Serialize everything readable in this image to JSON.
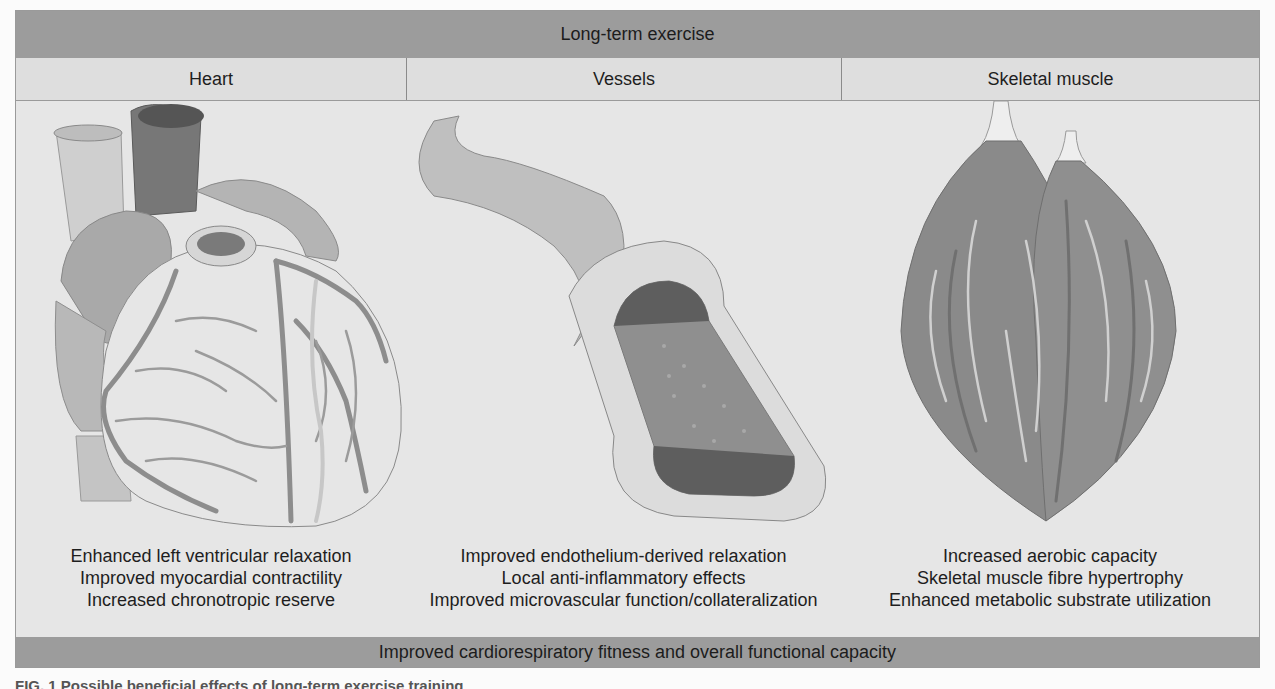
{
  "figure": {
    "top_banner": "Long-term exercise",
    "columns": [
      {
        "header": "Heart",
        "illustration": "heart-illustration",
        "effects": [
          "Enhanced left ventricular relaxation",
          "Improved myocardial contractility",
          "Increased chronotropic reserve"
        ]
      },
      {
        "header": "Vessels",
        "illustration": "blood-vessel-illustration",
        "effects": [
          "Improved endothelium-derived relaxation",
          "Local anti-inflammatory effects",
          "Improved microvascular function/collateralization"
        ]
      },
      {
        "header": "Skeletal muscle",
        "illustration": "skeletal-muscle-illustration",
        "effects": [
          "Increased aerobic capacity",
          "Skeletal muscle fibre hypertrophy",
          "Enhanced metabolic substrate utilization"
        ]
      }
    ],
    "bottom_banner": "Improved cardiorespiratory fitness and overall functional capacity"
  },
  "caption": {
    "text": "FIG. 1 Possible beneficial effects of long-term exercise training"
  },
  "colors": {
    "banner": "#9c9c9c",
    "panel": "#e6e6e6",
    "text": "#1e1e1e"
  }
}
